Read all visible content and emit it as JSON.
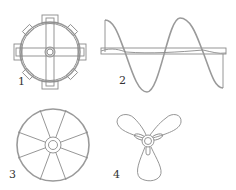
{
  "figure": {
    "stroke_color": "#8a8a8a",
    "items": [
      {
        "label": "1",
        "name": "paddle-impeller-with-tabs"
      },
      {
        "label": "2",
        "name": "helical-ribbon-impeller"
      },
      {
        "label": "3",
        "name": "spoked-wheel-impeller"
      },
      {
        "label": "4",
        "name": "three-blade-propeller"
      }
    ]
  }
}
